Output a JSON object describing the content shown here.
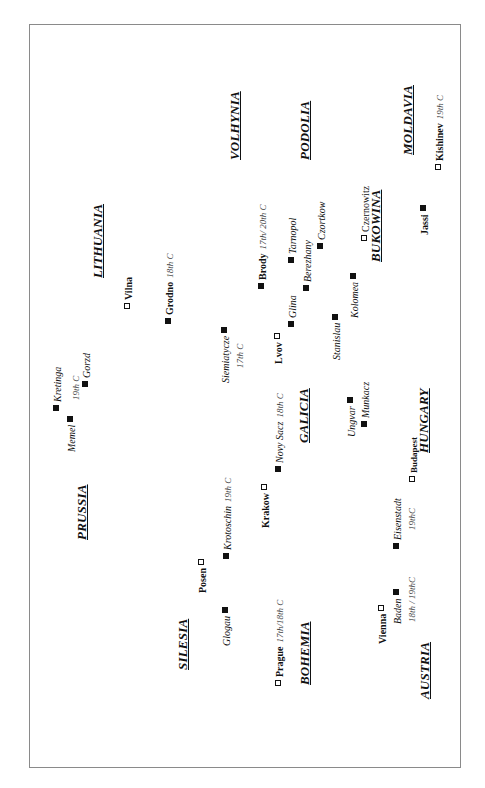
{
  "regions": {
    "volhynia": "VOLHYNIA",
    "podolia": "PODOLIA",
    "moldavia": "MOLDAVIA",
    "bukowina": "BUKOWINA",
    "lithuania": "LITHUANIA",
    "galicia": "GALICIA",
    "hungary": "HUNGARY",
    "prussia": "PRUSSIA",
    "silesia": "SILESIA",
    "bohemia": "BOHEMIA",
    "austria": "AUSTRIA"
  },
  "legend_markers": {
    "filled": "filled-square",
    "open": "open-square"
  },
  "cities": {
    "kishinev": {
      "name": "Kishinev",
      "note": "19th C",
      "marker": "open"
    },
    "jassi": {
      "name": "Jassi",
      "marker": "filled"
    },
    "czernowitz": {
      "name": "Czernowitz",
      "marker": "open"
    },
    "czortkow": {
      "name": "Czortkow",
      "marker": "filled"
    },
    "tarnopol": {
      "name": "Tarnopol",
      "marker": "filled"
    },
    "berezhany": {
      "name": "Berezhany",
      "marker": "filled"
    },
    "brody": {
      "name": "Brody",
      "note": "17th/ 20th C",
      "marker": "filled"
    },
    "kolomea": {
      "name": "Kolomea",
      "marker": "filled"
    },
    "glina": {
      "name": "Glina",
      "marker": "filled"
    },
    "lvov": {
      "name": "Lvov",
      "marker": "open"
    },
    "stanislau": {
      "name": "Stanislau",
      "marker": "filled"
    },
    "vilna": {
      "name": "Vilna",
      "marker": "open"
    },
    "grodno": {
      "name": "Grodno",
      "note": "18th C",
      "marker": "filled"
    },
    "siemiatycze": {
      "name": "Siemiatycze",
      "note": "17th C",
      "marker": "filled"
    },
    "munkacz": {
      "name": "Munkacz",
      "marker": "filled"
    },
    "ungvar": {
      "name": "Ungvar",
      "marker": "filled"
    },
    "kretinga": {
      "name": "Kretinga",
      "marker": "filled"
    },
    "memel": {
      "name": "Memel",
      "note": "19th C",
      "marker": "filled"
    },
    "gorzd": {
      "name": "Gorzd",
      "marker": "filled"
    },
    "novy_sacz": {
      "name": "Novy Sacz",
      "note": "18th C",
      "marker": "filled"
    },
    "krakow": {
      "name": "Krakow",
      "marker": "open"
    },
    "krotoschin": {
      "name": "Krotoschin",
      "note": "19th C",
      "marker": "filled"
    },
    "budapest": {
      "name": "Budapest",
      "marker": "open"
    },
    "eisenstadt": {
      "name": "Eisenstadt",
      "note": "19thC",
      "marker": "filled"
    },
    "posen": {
      "name": "Posen",
      "marker": "open"
    },
    "glogau": {
      "name": "Glogau",
      "marker": "filled"
    },
    "prague": {
      "name": "Prague",
      "note": "17th/18th C",
      "marker": "open"
    },
    "vienna": {
      "name": "Vienna",
      "marker": "open"
    },
    "baden": {
      "name": "Baden",
      "note": "18th / 19thC",
      "marker": "filled"
    }
  }
}
